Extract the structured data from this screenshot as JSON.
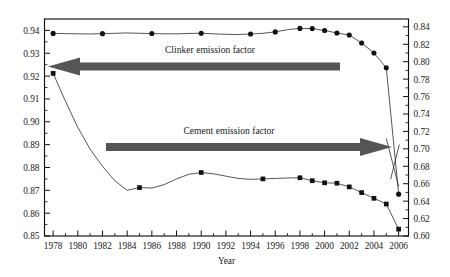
{
  "chart_data": {
    "type": "line",
    "title": "",
    "xlabel": "Year",
    "ylabel": "",
    "grid": false,
    "legend_position": "inline-annotations",
    "x": [
      1978,
      1979,
      1980,
      1981,
      1982,
      1983,
      1984,
      1985,
      1986,
      1987,
      1988,
      1989,
      1990,
      1991,
      1992,
      1993,
      1994,
      1995,
      1996,
      1997,
      1998,
      1999,
      2000,
      2001,
      2002,
      2003,
      2004,
      2005,
      2006
    ],
    "xlim": [
      1977.3,
      2006.8
    ],
    "x_tick_labels": [
      "1978",
      "1980",
      "1982",
      "1984",
      "1986",
      "1988",
      "1990",
      "1992",
      "1994",
      "1996",
      "1998",
      "2000",
      "2002",
      "2004",
      "2006"
    ],
    "x_tick_values": [
      1978,
      1980,
      1982,
      1984,
      1986,
      1988,
      1990,
      1992,
      1994,
      1996,
      1998,
      2000,
      2002,
      2004,
      2006
    ],
    "x_minor_tick_values": [
      1979,
      1981,
      1983,
      1985,
      1987,
      1989,
      1991,
      1993,
      1995,
      1997,
      1999,
      2001,
      2003,
      2005
    ],
    "left_axis": {
      "ylim": [
        0.85,
        0.945
      ],
      "tick_labels": [
        "0.85",
        "0.86",
        "0.87",
        "0.88",
        "0.89",
        "0.90",
        "0.91",
        "0.92",
        "0.93",
        "0.94"
      ],
      "tick_values": [
        0.85,
        0.86,
        0.87,
        0.88,
        0.89,
        0.9,
        0.91,
        0.92,
        0.93,
        0.94
      ],
      "minor_tick_values": [
        0.855,
        0.865,
        0.875,
        0.885,
        0.895,
        0.905,
        0.915,
        0.925,
        0.935
      ]
    },
    "right_axis": {
      "ylim": [
        0.6,
        0.849
      ],
      "tick_labels": [
        "0.60",
        "0.62",
        "0.64",
        "0.66",
        "0.68",
        "0.70",
        "0.72",
        "0.74",
        "0.76",
        "0.78",
        "0.80",
        "0.82",
        "0.84"
      ],
      "tick_values": [
        0.6,
        0.62,
        0.64,
        0.66,
        0.68,
        0.7,
        0.72,
        0.74,
        0.76,
        0.78,
        0.8,
        0.82,
        0.84
      ],
      "minor_tick_values": [
        0.61,
        0.63,
        0.65,
        0.67,
        0.69,
        0.71,
        0.73,
        0.75,
        0.77,
        0.79,
        0.81,
        0.83
      ]
    },
    "series": [
      {
        "name": "Clinker emission factor",
        "axis": "right",
        "marker": "circle",
        "values": [
          0.8325,
          0.8322,
          0.832,
          0.8318,
          0.8322,
          0.8326,
          0.833,
          0.8326,
          0.8323,
          0.832,
          0.832,
          0.8324,
          0.8327,
          0.832,
          0.8314,
          0.8312,
          0.8318,
          0.8326,
          0.8342,
          0.8368,
          0.8382,
          0.838,
          0.8358,
          0.833,
          0.8305,
          0.8215,
          0.81,
          0.793,
          0.648
        ],
        "marked_points_x": [
          1978,
          1982,
          1986,
          1990,
          1994,
          1996,
          1998,
          1999,
          2000,
          2001,
          2002,
          2003,
          2004,
          2005,
          2006
        ]
      },
      {
        "name": "Cement emission factor",
        "axis": "left",
        "marker": "square",
        "values": [
          0.9212,
          0.909,
          0.8975,
          0.888,
          0.8805,
          0.8742,
          0.87,
          0.8712,
          0.871,
          0.8725,
          0.875,
          0.877,
          0.8778,
          0.8772,
          0.8762,
          0.8752,
          0.8748,
          0.875,
          0.8752,
          0.8754,
          0.8755,
          0.8742,
          0.8733,
          0.8731,
          0.8715,
          0.869,
          0.8665,
          0.864,
          0.853
        ],
        "marked_points_x": [
          1978,
          1985,
          1990,
          1995,
          1998,
          1999,
          2000,
          2001,
          2002,
          2003,
          2004,
          2005,
          2006
        ]
      }
    ],
    "annotations": [
      {
        "id": "clinker-arrow",
        "text": "Clinker emission factor",
        "direction": "left",
        "points_to_axis": "left",
        "description": "Thick gray arrow pointing left toward the left-hand axis"
      },
      {
        "id": "cement-arrow",
        "text": "Cement emission factor",
        "direction": "right",
        "points_to_axis": "right",
        "description": "Thick gray arrow pointing right toward the right-hand axis"
      }
    ],
    "colors": {
      "line": "#2b2b2b",
      "marker": "#111111",
      "arrow": "#555555",
      "axis": "#111111",
      "background": "#ffffff"
    }
  }
}
